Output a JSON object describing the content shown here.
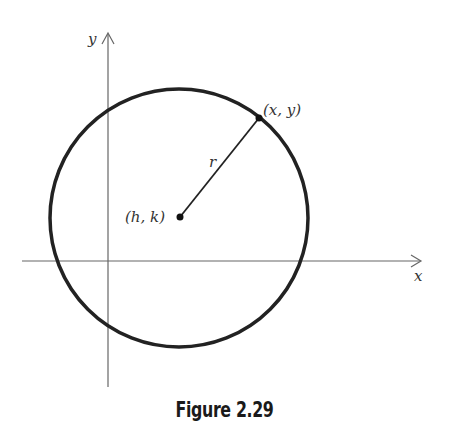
{
  "diagram": {
    "type": "circle-standard-form",
    "axes": {
      "x_label": "x",
      "y_label": "y"
    },
    "center": {
      "label": "(h, k)"
    },
    "point_on_circle": {
      "label": "(x, y)"
    },
    "radius": {
      "label": "r"
    },
    "colors": {
      "stroke": "#222222",
      "axis": "#555555",
      "text": "#333333"
    }
  },
  "caption": "Figure 2.29"
}
